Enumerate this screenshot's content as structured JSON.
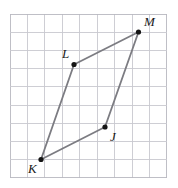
{
  "figure": {
    "type": "geometry-quadrilateral-on-grid",
    "name": "quadrilateral-JKLM",
    "background_color": "#ffffff",
    "grid": {
      "x0": 10,
      "y0": 14,
      "x1": 167,
      "y1": 178,
      "columns": 9,
      "rows": 9,
      "cell_width": 17.44,
      "cell_height": 18.22,
      "line_color": "#c9c9cf",
      "border_color": "#b8b8c0",
      "line_width": 0.9
    },
    "shape": {
      "stroke_color": "#7c7c82",
      "stroke_width": 1.8,
      "vertex_color": "#151515",
      "vertex_radius": 2.6,
      "closed": true,
      "order": [
        "J",
        "K",
        "L",
        "M"
      ]
    },
    "vertices": [
      {
        "id": "M",
        "label": "M",
        "x": 138.5,
        "y": 32.0,
        "label_x": 144,
        "label_y": 15
      },
      {
        "id": "L",
        "label": "L",
        "x": 74.0,
        "y": 64.5,
        "label_x": 62,
        "label_y": 47
      },
      {
        "id": "J",
        "label": "J",
        "x": 105.0,
        "y": 127.0,
        "label_x": 110,
        "label_y": 130
      },
      {
        "id": "K",
        "label": "K",
        "x": 41.0,
        "y": 159.5,
        "label_x": 28,
        "label_y": 162
      }
    ],
    "edges": [
      {
        "name": "edge-K-L",
        "from": "K",
        "to": "L"
      },
      {
        "name": "edge-L-M",
        "from": "L",
        "to": "M"
      },
      {
        "name": "edge-M-J",
        "from": "M",
        "to": "J"
      },
      {
        "name": "edge-J-K",
        "from": "J",
        "to": "K"
      }
    ]
  },
  "chart_data": {
    "type": "scatter",
    "title": "",
    "xlabel": "",
    "ylabel": "",
    "grid": true,
    "legend": null,
    "categories": [
      "J",
      "K",
      "L",
      "M"
    ],
    "series": [
      {
        "name": "quadrilateral JKLM vertices (grid units, origin at grid bottom-left)",
        "points": [
          {
            "label": "J",
            "x": 5.45,
            "y": 2.8
          },
          {
            "label": "K",
            "x": 1.78,
            "y": 1.0
          },
          {
            "label": "L",
            "x": 3.67,
            "y": 6.23
          },
          {
            "label": "M",
            "x": 7.37,
            "y": 8.01
          }
        ]
      }
    ],
    "xlim": [
      0,
      9
    ],
    "ylim": [
      0,
      9
    ],
    "annotations": [
      "J",
      "K",
      "L",
      "M"
    ]
  }
}
